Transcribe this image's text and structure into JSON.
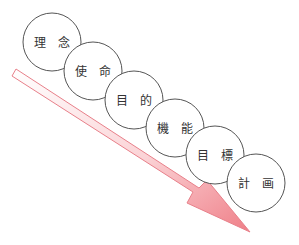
{
  "diagram": {
    "arrow": {
      "color": "#f08080",
      "outline": "#e57a85",
      "from": [
        14,
        72
      ],
      "to": [
        250,
        232
      ]
    },
    "circles": [
      {
        "cx": 52,
        "cy": 42,
        "r": 29,
        "chars": [
          "理",
          "念"
        ]
      },
      {
        "cx": 93,
        "cy": 71,
        "r": 29,
        "chars": [
          "使",
          "命"
        ]
      },
      {
        "cx": 134,
        "cy": 100,
        "r": 29,
        "chars": [
          "目",
          "的"
        ]
      },
      {
        "cx": 175,
        "cy": 128,
        "r": 29,
        "chars": [
          "機",
          "能"
        ]
      },
      {
        "cx": 215,
        "cy": 155,
        "r": 29,
        "chars": [
          "目",
          "標"
        ]
      },
      {
        "cx": 256,
        "cy": 183,
        "r": 29,
        "chars": [
          "計",
          "画"
        ]
      }
    ]
  }
}
